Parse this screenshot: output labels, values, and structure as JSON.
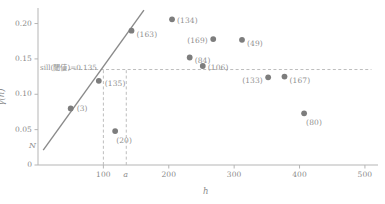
{
  "chart_data": {
    "type": "scatter",
    "title": "",
    "xlabel": "h",
    "ylabel": "γ(h)",
    "xlim": [
      0,
      520
    ],
    "ylim": [
      0,
      0.222
    ],
    "grid": false,
    "legend": null,
    "x_ticks": [
      100,
      200,
      300,
      400,
      500
    ],
    "x_tick_labels": [
      "100",
      "200",
      "300",
      "400",
      "500"
    ],
    "y_ticks": [
      0,
      0.05,
      0.1,
      0.15,
      0.2
    ],
    "y_tick_labels": [
      "0",
      "0.05",
      "0.10",
      "0.15",
      "0.20"
    ],
    "point_label_note": "values in parentheses are the number of data pairs for each lag",
    "points": [
      {
        "label": "(3)",
        "x": 50,
        "y": 0.08
      },
      {
        "label": "(135)",
        "x": 93,
        "y": 0.119
      },
      {
        "label": "(163)",
        "x": 143,
        "y": 0.19
      },
      {
        "label": "(20)",
        "x": 118,
        "y": 0.048
      },
      {
        "label": "(134)",
        "x": 205,
        "y": 0.206
      },
      {
        "label": "(84)",
        "x": 232,
        "y": 0.152
      },
      {
        "label": "(169)",
        "x": 268,
        "y": 0.178
      },
      {
        "label": "(106)",
        "x": 252,
        "y": 0.14
      },
      {
        "label": "(49)",
        "x": 312,
        "y": 0.177
      },
      {
        "label": "(133)",
        "x": 352,
        "y": 0.124
      },
      {
        "label": "(167)",
        "x": 377,
        "y": 0.125
      },
      {
        "label": "(80)",
        "x": 407,
        "y": 0.073
      }
    ],
    "fitted_line": {
      "x0": 8,
      "y0": 0.021,
      "x1": 162,
      "y1": 0.219
    },
    "sill": {
      "value": 0.135,
      "label": "sill(閾値)=0.135",
      "line_x_start": 38,
      "line_x_end": 510
    },
    "range_marker": {
      "value": 135,
      "label": "a"
    },
    "reference_vline": {
      "value": 100
    },
    "nugget_marker": {
      "label": "N",
      "value": 0.021
    },
    "colors": {
      "point": "#7d7d7d",
      "line": "#8a8a8a",
      "axis": "#b5b5b5",
      "dashed": "#bdbdbd",
      "text": "#8f8f8f",
      "background": "#ffffff"
    }
  }
}
